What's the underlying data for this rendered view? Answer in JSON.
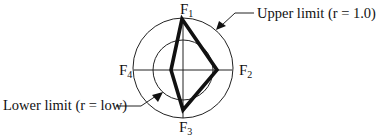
{
  "diagram": {
    "type": "radar-limit-diagram",
    "axes": [
      {
        "id": "F1",
        "letter": "F",
        "subscript": "1",
        "position": "top"
      },
      {
        "id": "F2",
        "letter": "F",
        "subscript": "2",
        "position": "right"
      },
      {
        "id": "F3",
        "letter": "F",
        "subscript": "3",
        "position": "bottom"
      },
      {
        "id": "F4",
        "letter": "F",
        "subscript": "4",
        "position": "left"
      }
    ],
    "circles": {
      "upper": {
        "label": "Upper limit (r = 1.0)",
        "r": 1.0
      },
      "lower": {
        "label": "Lower limit (r = low)",
        "r": "low"
      }
    },
    "profile_polygon": {
      "description": "Bold kite-shaped profile connecting the four factor values",
      "vertices_relative_radius": {
        "F1": 1.0,
        "F2": 0.7,
        "F3": 0.85,
        "F4": 0.25
      }
    },
    "colors": {
      "line": "#111111",
      "background": "#ffffff"
    }
  }
}
